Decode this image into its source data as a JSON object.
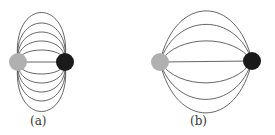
{
  "figures": [
    {
      "label": "(a)",
      "left_charge_color": "#b0b0b0",
      "right_charge_color": "#1a1a1a",
      "field_lines": 11
    },
    {
      "label": "(b)",
      "left_charge_color": "#b0b0b0",
      "right_charge_color": "#1a1a1a",
      "field_lines": 7
    }
  ]
}
